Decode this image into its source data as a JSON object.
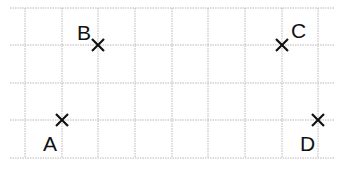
{
  "diagram": {
    "type": "grid-points",
    "grid": {
      "x_lines": [
        25,
        62,
        98,
        135,
        172,
        208,
        245,
        282,
        318
      ],
      "y_lines": [
        8,
        45,
        83,
        120,
        158
      ],
      "x_extent": [
        10,
        335
      ],
      "y_extent": [
        8,
        158
      ],
      "color": "#b8b8b8"
    },
    "points": [
      {
        "label": "A",
        "x": 62,
        "y": 120,
        "label_x": 43,
        "label_y": 151
      },
      {
        "label": "B",
        "x": 98,
        "y": 45,
        "label_x": 77,
        "label_y": 40
      },
      {
        "label": "C",
        "x": 282,
        "y": 45,
        "label_x": 291,
        "label_y": 38
      },
      {
        "label": "D",
        "x": 318,
        "y": 120,
        "label_x": 300,
        "label_y": 151
      }
    ],
    "mark_color": "#111111"
  }
}
